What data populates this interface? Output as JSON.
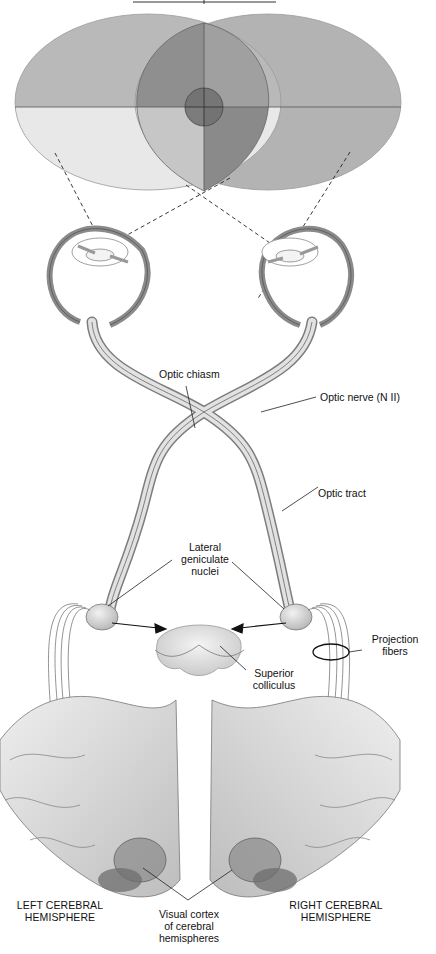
{
  "title": {
    "text": "",
    "underline_visible": true
  },
  "visual_field": {
    "regions": [
      {
        "name": "left-field-upper-outer",
        "color": "#b9b9b9"
      },
      {
        "name": "left-field-lower-outer",
        "color": "#e8e8e8"
      },
      {
        "name": "binocular-upper-left",
        "color": "#8f8f8f"
      },
      {
        "name": "binocular-upper-right",
        "color": "#a0a0a0"
      },
      {
        "name": "binocular-lower-left",
        "color": "#c6c6c6"
      },
      {
        "name": "binocular-lower-right",
        "color": "#8a8a8a"
      },
      {
        "name": "right-field-outer",
        "color": "#b3b3b3"
      },
      {
        "name": "fovea",
        "color": "#6f6f6f"
      }
    ]
  },
  "labels": {
    "optic_chiasm": "Optic chiasm",
    "optic_nerve": "Optic nerve (N II)",
    "optic_tract": "Optic tract",
    "lateral_geniculate_nuclei": [
      "Lateral",
      "geniculate",
      "nuclei"
    ],
    "projection_fibers": [
      "Projection",
      "fibers"
    ],
    "superior_colliculus": [
      "Superior",
      "colliculus"
    ],
    "left_hemisphere": [
      "LEFT CEREBRAL",
      "HEMISPHERE"
    ],
    "right_hemisphere": [
      "RIGHT CEREBRAL",
      "HEMISPHERE"
    ],
    "visual_cortex": [
      "Visual cortex",
      "of cerebral",
      "hemispheres"
    ]
  },
  "colors": {
    "nerve_fill": "#d9d9d9",
    "nerve_stroke": "#555555",
    "brain_fill": "#dcdcdc",
    "cortex_dark": "#6e6e6e",
    "leader_line": "#222222"
  }
}
